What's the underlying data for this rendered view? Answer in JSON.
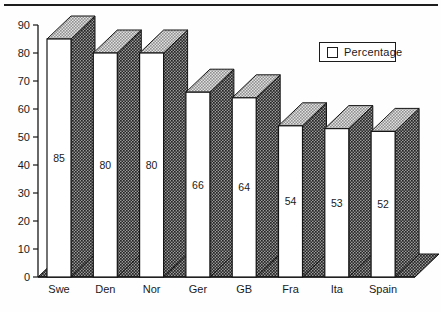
{
  "chart_data": {
    "type": "bar",
    "style": "3d-halftone-scan",
    "title": "",
    "xlabel": "",
    "ylabel": "",
    "categories": [
      "Swe",
      "Den",
      "Nor",
      "Ger",
      "GB",
      "Fra",
      "Ita",
      "Spain"
    ],
    "series": [
      {
        "name": "Percentage",
        "values": [
          85,
          80,
          80,
          66,
          64,
          54,
          53,
          52
        ]
      }
    ],
    "value_labels": [
      "85",
      "80",
      "80",
      "66",
      "64",
      "54",
      "53",
      "52"
    ],
    "value_labels_shown": true,
    "ylim": [
      0,
      90
    ],
    "yticks": [
      0,
      10,
      20,
      30,
      40,
      50,
      60,
      70,
      80,
      90
    ],
    "grid": false,
    "legend": {
      "position": "top-right",
      "label": "Percentage"
    },
    "colors": {
      "bar_front": "#ffffff",
      "bar_top_avg": "#b2b2b2",
      "bar_side_avg": "#5e5e5e",
      "outline": "#161616",
      "text": "#1a1a1a",
      "background": "#fefefe"
    }
  }
}
